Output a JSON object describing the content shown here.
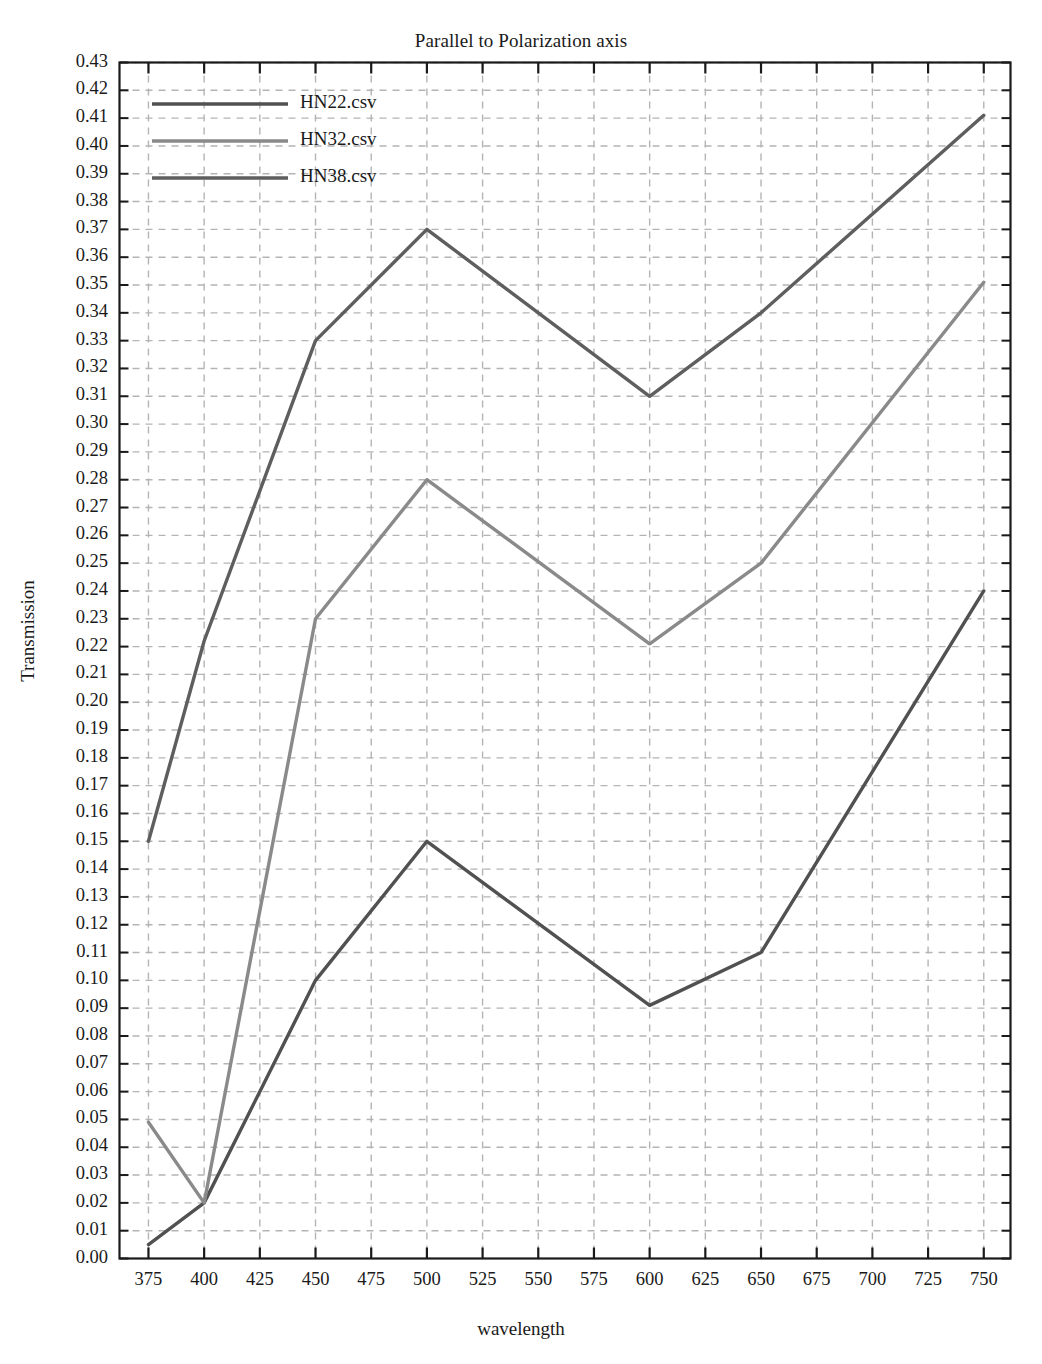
{
  "chart_data": {
    "type": "line",
    "title": "Parallel to Polarization axis",
    "xlabel": "wavelength",
    "ylabel": "Transmission",
    "grid": true,
    "grid_style": "dashed",
    "legend_position": "upper left",
    "xlim": [
      362,
      762
    ],
    "ylim": [
      0.0,
      0.43
    ],
    "xticks": [
      375,
      400,
      425,
      450,
      475,
      500,
      525,
      550,
      575,
      600,
      625,
      650,
      675,
      700,
      725,
      750
    ],
    "yticks": [
      "0.00",
      "0.01",
      "0.02",
      "0.03",
      "0.04",
      "0.05",
      "0.06",
      "0.07",
      "0.08",
      "0.09",
      "0.10",
      "0.11",
      "0.12",
      "0.13",
      "0.14",
      "0.15",
      "0.16",
      "0.17",
      "0.18",
      "0.19",
      "0.20",
      "0.21",
      "0.22",
      "0.23",
      "0.24",
      "0.25",
      "0.26",
      "0.27",
      "0.28",
      "0.29",
      "0.30",
      "0.31",
      "0.32",
      "0.33",
      "0.34",
      "0.35",
      "0.36",
      "0.37",
      "0.38",
      "0.39",
      "0.40",
      "0.41",
      "0.42",
      "0.43"
    ],
    "x": [
      375,
      400,
      450,
      500,
      600,
      650,
      750
    ],
    "series": [
      {
        "name": "HN22.csv",
        "color": "#515151",
        "values": [
          0.005,
          0.02,
          0.1,
          0.15,
          0.091,
          0.11,
          0.24
        ]
      },
      {
        "name": "HN32.csv",
        "color": "#8a8a8a",
        "values": [
          0.049,
          0.02,
          0.23,
          0.28,
          0.221,
          0.25,
          0.351
        ]
      },
      {
        "name": "HN38.csv",
        "color": "#5e5e5e",
        "values": [
          0.15,
          0.222,
          0.33,
          0.37,
          0.31,
          0.34,
          0.411
        ]
      }
    ]
  },
  "legend": {
    "entries": [
      {
        "label": "HN22.csv"
      },
      {
        "label": "HN32.csv"
      },
      {
        "label": "HN38.csv"
      }
    ]
  },
  "colors": {
    "axis": "#1a1a1a",
    "grid": "#b4b4b4",
    "background": "#ffffff"
  }
}
